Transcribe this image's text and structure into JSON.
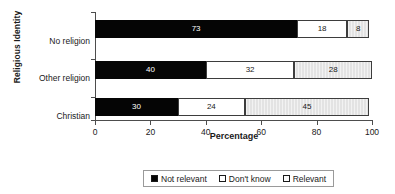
{
  "chart_data": {
    "type": "bar",
    "orientation": "horizontal",
    "stacked": true,
    "title": "",
    "xlabel": "Percentage",
    "ylabel": "Religious Identity",
    "categories": [
      "No religion",
      "Other religion",
      "Christian"
    ],
    "series": [
      {
        "name": "Not relevant",
        "values": [
          73,
          40,
          30
        ],
        "color": "#050505"
      },
      {
        "name": "Don't know",
        "values": [
          18,
          32,
          24
        ],
        "color": "#ffffff"
      },
      {
        "name": "Relevant",
        "values": [
          8,
          28,
          45
        ],
        "color": "#e3e3e3"
      }
    ],
    "xlim": [
      0,
      100
    ],
    "xticks": [
      0,
      20,
      40,
      60,
      80,
      100
    ],
    "grid": false,
    "legend_position": "bottom"
  },
  "axes": {
    "x_title": "Percentage",
    "y_title": "Religious Identity",
    "x_ticks": [
      "0",
      "20",
      "40",
      "60",
      "80",
      "100"
    ],
    "y_ticks": [
      "No religion",
      "Other religion",
      "Christian"
    ]
  },
  "bars": {
    "row0": {
      "category": "No religion",
      "s0": "73",
      "s1": "18",
      "s2": "8"
    },
    "row1": {
      "category": "Other religion",
      "s0": "40",
      "s1": "32",
      "s2": "28"
    },
    "row2": {
      "category": "Christian",
      "s0": "30",
      "s1": "24",
      "s2": "45"
    }
  },
  "legend": {
    "items": [
      {
        "label": "Not relevant"
      },
      {
        "label": "Don't know"
      },
      {
        "label": "Relevant"
      }
    ]
  }
}
